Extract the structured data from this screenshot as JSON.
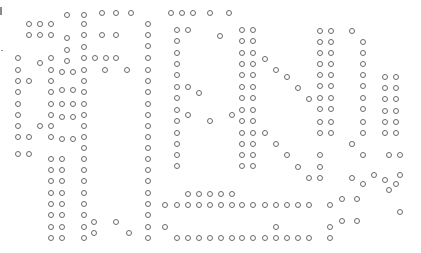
{
  "image": {
    "description": "dot-matrix pattern of small circles forming stylized glyphs",
    "dot_color": "#6a6a6a",
    "background": "#ffffff"
  },
  "dots": [
    [
      67,
      15
    ],
    [
      84,
      15
    ],
    [
      102,
      13
    ],
    [
      116,
      13
    ],
    [
      131,
      13
    ],
    [
      29,
      24
    ],
    [
      40,
      24
    ],
    [
      51,
      24
    ],
    [
      84,
      24
    ],
    [
      29,
      35
    ],
    [
      40,
      35
    ],
    [
      51,
      35
    ],
    [
      67,
      38
    ],
    [
      84,
      35
    ],
    [
      102,
      35
    ],
    [
      116,
      35
    ],
    [
      67,
      50
    ],
    [
      84,
      47
    ],
    [
      18,
      58
    ],
    [
      40,
      63
    ],
    [
      51,
      58
    ],
    [
      67,
      61
    ],
    [
      84,
      58
    ],
    [
      95,
      58
    ],
    [
      106,
      58
    ],
    [
      116,
      58
    ],
    [
      18,
      70
    ],
    [
      51,
      70
    ],
    [
      62,
      72
    ],
    [
      73,
      72
    ],
    [
      84,
      70
    ],
    [
      105,
      70
    ],
    [
      127,
      70
    ],
    [
      18,
      81
    ],
    [
      29,
      81
    ],
    [
      51,
      81
    ],
    [
      84,
      81
    ],
    [
      18,
      92
    ],
    [
      51,
      92
    ],
    [
      62,
      90
    ],
    [
      73,
      90
    ],
    [
      84,
      92
    ],
    [
      18,
      104
    ],
    [
      51,
      104
    ],
    [
      62,
      104
    ],
    [
      73,
      104
    ],
    [
      84,
      104
    ],
    [
      18,
      115
    ],
    [
      51,
      115
    ],
    [
      62,
      117
    ],
    [
      73,
      117
    ],
    [
      84,
      115
    ],
    [
      18,
      126
    ],
    [
      40,
      126
    ],
    [
      51,
      126
    ],
    [
      84,
      126
    ],
    [
      18,
      137
    ],
    [
      29,
      137
    ],
    [
      51,
      137
    ],
    [
      62,
      139
    ],
    [
      73,
      139
    ],
    [
      84,
      137
    ],
    [
      84,
      148
    ],
    [
      18,
      154
    ],
    [
      29,
      154
    ],
    [
      51,
      159
    ],
    [
      62,
      159
    ],
    [
      84,
      159
    ],
    [
      51,
      170
    ],
    [
      62,
      170
    ],
    [
      84,
      170
    ],
    [
      51,
      181
    ],
    [
      62,
      181
    ],
    [
      84,
      181
    ],
    [
      51,
      193
    ],
    [
      62,
      193
    ],
    [
      84,
      193
    ],
    [
      51,
      204
    ],
    [
      62,
      204
    ],
    [
      84,
      204
    ],
    [
      51,
      215
    ],
    [
      62,
      215
    ],
    [
      84,
      215
    ],
    [
      94,
      222
    ],
    [
      116,
      222
    ],
    [
      51,
      227
    ],
    [
      62,
      227
    ],
    [
      84,
      227
    ],
    [
      94,
      233
    ],
    [
      129,
      233
    ],
    [
      51,
      238
    ],
    [
      62,
      238
    ],
    [
      84,
      238
    ],
    [
      171,
      13
    ],
    [
      182,
      13
    ],
    [
      193,
      13
    ],
    [
      210,
      13
    ],
    [
      229,
      13
    ],
    [
      148,
      24
    ],
    [
      148,
      35
    ],
    [
      148,
      46
    ],
    [
      148,
      58
    ],
    [
      148,
      70
    ],
    [
      148,
      81
    ],
    [
      148,
      92
    ],
    [
      148,
      104
    ],
    [
      148,
      115
    ],
    [
      148,
      126
    ],
    [
      148,
      137
    ],
    [
      148,
      148
    ],
    [
      148,
      159
    ],
    [
      148,
      170
    ],
    [
      148,
      181
    ],
    [
      148,
      193
    ],
    [
      148,
      204
    ],
    [
      148,
      215
    ],
    [
      148,
      227
    ],
    [
      148,
      238
    ],
    [
      177,
      30
    ],
    [
      188,
      30
    ],
    [
      220,
      36
    ],
    [
      242,
      30
    ],
    [
      253,
      30
    ],
    [
      177,
      41
    ],
    [
      242,
      41
    ],
    [
      253,
      41
    ],
    [
      177,
      53
    ],
    [
      242,
      53
    ],
    [
      253,
      53
    ],
    [
      265,
      59
    ],
    [
      177,
      64
    ],
    [
      242,
      64
    ],
    [
      253,
      64
    ],
    [
      276,
      70
    ],
    [
      177,
      75
    ],
    [
      242,
      75
    ],
    [
      253,
      75
    ],
    [
      177,
      87
    ],
    [
      188,
      87
    ],
    [
      242,
      87
    ],
    [
      253,
      87
    ],
    [
      199,
      93
    ],
    [
      242,
      98
    ],
    [
      253,
      98
    ],
    [
      177,
      98
    ],
    [
      177,
      110
    ],
    [
      188,
      115
    ],
    [
      210,
      121
    ],
    [
      232,
      115
    ],
    [
      242,
      110
    ],
    [
      253,
      110
    ],
    [
      177,
      121
    ],
    [
      242,
      121
    ],
    [
      253,
      121
    ],
    [
      177,
      133
    ],
    [
      242,
      133
    ],
    [
      253,
      133
    ],
    [
      265,
      133
    ],
    [
      177,
      144
    ],
    [
      242,
      144
    ],
    [
      253,
      144
    ],
    [
      276,
      144
    ],
    [
      177,
      155
    ],
    [
      242,
      155
    ],
    [
      253,
      155
    ],
    [
      177,
      166
    ],
    [
      242,
      166
    ],
    [
      253,
      166
    ],
    [
      188,
      194
    ],
    [
      199,
      194
    ],
    [
      210,
      194
    ],
    [
      221,
      194
    ],
    [
      232,
      194
    ],
    [
      165,
      205
    ],
    [
      177,
      205
    ],
    [
      188,
      205
    ],
    [
      199,
      205
    ],
    [
      210,
      205
    ],
    [
      221,
      205
    ],
    [
      232,
      205
    ],
    [
      242,
      205
    ],
    [
      253,
      205
    ],
    [
      265,
      205
    ],
    [
      276,
      205
    ],
    [
      287,
      205
    ],
    [
      298,
      205
    ],
    [
      309,
      205
    ],
    [
      330,
      205
    ],
    [
      165,
      227
    ],
    [
      177,
      238
    ],
    [
      188,
      238
    ],
    [
      199,
      238
    ],
    [
      210,
      238
    ],
    [
      221,
      238
    ],
    [
      232,
      238
    ],
    [
      242,
      238
    ],
    [
      253,
      238
    ],
    [
      265,
      238
    ],
    [
      276,
      238
    ],
    [
      287,
      238
    ],
    [
      298,
      238
    ],
    [
      309,
      238
    ],
    [
      330,
      238
    ],
    [
      276,
      227
    ],
    [
      330,
      227
    ],
    [
      342,
      221
    ],
    [
      342,
      199
    ],
    [
      357,
      199
    ],
    [
      357,
      221
    ],
    [
      320,
      31
    ],
    [
      331,
      31
    ],
    [
      352,
      31
    ],
    [
      320,
      42
    ],
    [
      331,
      42
    ],
    [
      363,
      42
    ],
    [
      320,
      53
    ],
    [
      331,
      53
    ],
    [
      363,
      53
    ],
    [
      320,
      64
    ],
    [
      331,
      64
    ],
    [
      363,
      64
    ],
    [
      287,
      77
    ],
    [
      320,
      75
    ],
    [
      331,
      75
    ],
    [
      363,
      75
    ],
    [
      385,
      77
    ],
    [
      396,
      77
    ],
    [
      298,
      88
    ],
    [
      320,
      86
    ],
    [
      331,
      86
    ],
    [
      363,
      86
    ],
    [
      385,
      88
    ],
    [
      396,
      88
    ],
    [
      309,
      99
    ],
    [
      320,
      98
    ],
    [
      331,
      98
    ],
    [
      363,
      98
    ],
    [
      385,
      99
    ],
    [
      396,
      99
    ],
    [
      320,
      109
    ],
    [
      331,
      109
    ],
    [
      363,
      109
    ],
    [
      385,
      111
    ],
    [
      396,
      111
    ],
    [
      320,
      122
    ],
    [
      331,
      122
    ],
    [
      363,
      122
    ],
    [
      385,
      122
    ],
    [
      396,
      122
    ],
    [
      320,
      133
    ],
    [
      331,
      133
    ],
    [
      352,
      144
    ],
    [
      363,
      133
    ],
    [
      385,
      133
    ],
    [
      396,
      133
    ],
    [
      287,
      155
    ],
    [
      320,
      155
    ],
    [
      363,
      155
    ],
    [
      389,
      155
    ],
    [
      400,
      155
    ],
    [
      298,
      167
    ],
    [
      320,
      167
    ],
    [
      374,
      175
    ],
    [
      385,
      180
    ],
    [
      400,
      175
    ],
    [
      309,
      178
    ],
    [
      320,
      178
    ],
    [
      352,
      178
    ],
    [
      363,
      184
    ],
    [
      396,
      184
    ],
    [
      400,
      212
    ],
    [
      389,
      190
    ]
  ]
}
